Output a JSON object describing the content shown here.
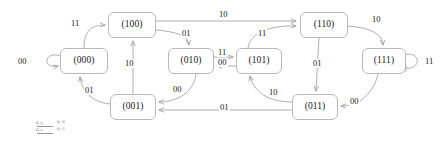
{
  "diagram": {
    "type": "finite-state-machine",
    "node_colors": {
      "border": "#b9b9b9",
      "fill": "#ffffff",
      "text": "#1a1a1a"
    },
    "edge_colors": {
      "stroke": "#9a9a9a",
      "label": "#1a1a1a"
    },
    "nodes": [
      {
        "id": "s000",
        "label": "(000)",
        "x": 60,
        "y": 48,
        "w": 48,
        "h": 26
      },
      {
        "id": "s100",
        "label": "(100)",
        "x": 108,
        "y": 12,
        "w": 48,
        "h": 26
      },
      {
        "id": "s010",
        "label": "(010)",
        "x": 168,
        "y": 48,
        "w": 46,
        "h": 26
      },
      {
        "id": "s101",
        "label": "(101)",
        "x": 236,
        "y": 48,
        "w": 46,
        "h": 26
      },
      {
        "id": "s110",
        "label": "(110)",
        "x": 300,
        "y": 12,
        "w": 48,
        "h": 26
      },
      {
        "id": "s111",
        "label": "(111)",
        "x": 362,
        "y": 48,
        "w": 44,
        "h": 26
      },
      {
        "id": "s001",
        "label": "(001)",
        "x": 110,
        "y": 94,
        "w": 46,
        "h": 26
      },
      {
        "id": "s011",
        "label": "(011)",
        "x": 292,
        "y": 94,
        "w": 46,
        "h": 26
      }
    ],
    "edges": [
      {
        "from": "s000",
        "to": "s000",
        "label": "00",
        "kind": "self-loop-left"
      },
      {
        "from": "s000",
        "to": "s100",
        "label": "11",
        "kind": "curve"
      },
      {
        "from": "s100",
        "to": "s110",
        "label": "10",
        "kind": "straight"
      },
      {
        "from": "s100",
        "to": "s010",
        "label": "01",
        "kind": "curve"
      },
      {
        "from": "s010",
        "to": "s101",
        "label": "11",
        "kind": "straight"
      },
      {
        "from": "s101",
        "to": "s010",
        "label": "00",
        "kind": "straight"
      },
      {
        "from": "s101",
        "to": "s110",
        "label": "11",
        "kind": "curve"
      },
      {
        "from": "s110",
        "to": "s111",
        "label": "10",
        "kind": "curve"
      },
      {
        "from": "s110",
        "to": "s011",
        "label": "01",
        "kind": "straight"
      },
      {
        "from": "s111",
        "to": "s111",
        "label": "11",
        "kind": "self-loop-right"
      },
      {
        "from": "s111",
        "to": "s011",
        "label": "00",
        "kind": "curve"
      },
      {
        "from": "s011",
        "to": "s101",
        "label": "10",
        "kind": "curve"
      },
      {
        "from": "s011",
        "to": "s001",
        "label": "01",
        "kind": "straight"
      },
      {
        "from": "s010",
        "to": "s001",
        "label": "00",
        "kind": "curve"
      },
      {
        "from": "s001",
        "to": "s100",
        "label": "10",
        "kind": "straight"
      },
      {
        "from": "s001",
        "to": "s000",
        "label": "01",
        "kind": "curve"
      }
    ],
    "edge_labels": {
      "e1": "00",
      "e2": "11",
      "e3": "10",
      "e4": "01",
      "e5": "11",
      "e6": "00",
      "e7": "11",
      "e8": "10",
      "e9": "01",
      "e10": "11",
      "e11": "00",
      "e12": "10",
      "e13": "01",
      "e14": "00",
      "e15": "10",
      "e16": "01"
    },
    "legend": {
      "rows": [
        {
          "key": "d₁ s₁",
          "value": "d₂=0"
        },
        {
          "key": "d₁ s₁",
          "value": "d₂=1"
        }
      ]
    }
  }
}
